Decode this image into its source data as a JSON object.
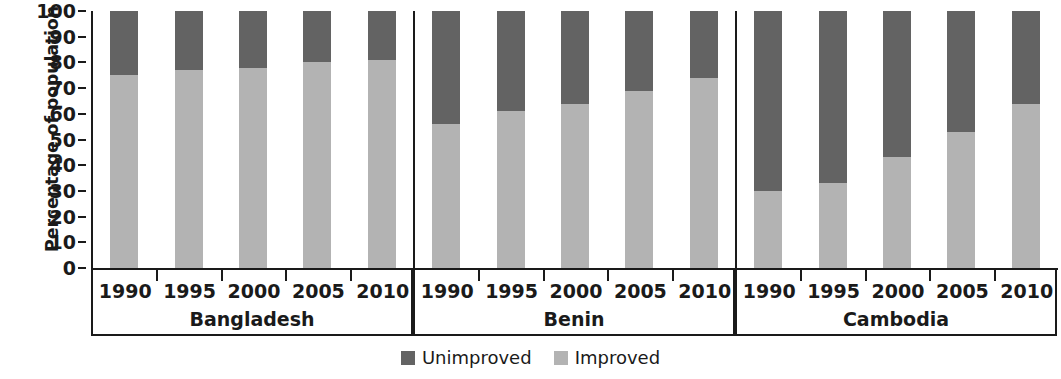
{
  "chart_data": {
    "type": "bar",
    "subtype": "stacked-bar-100",
    "title": "",
    "xlabel": "",
    "ylabel": "Percentage of population",
    "ylim": [
      0,
      100
    ],
    "ytick_labels": [
      "0",
      "10",
      "20",
      "30",
      "40",
      "50",
      "60",
      "70",
      "80",
      "90",
      "100"
    ],
    "ytick_values": [
      0,
      10,
      20,
      30,
      40,
      50,
      60,
      70,
      80,
      90,
      100
    ],
    "grid": false,
    "legend_position": "bottom-center",
    "groups": [
      "Bangladesh",
      "Benin",
      "Cambodia"
    ],
    "categories": [
      "1990",
      "1995",
      "2000",
      "2005",
      "2010"
    ],
    "series": [
      {
        "name": "Improved",
        "color": "#b3b3b3",
        "values_by_group": {
          "Bangladesh": [
            75,
            77,
            78,
            80,
            81
          ],
          "Benin": [
            56,
            61,
            64,
            69,
            74
          ],
          "Cambodia": [
            30,
            33,
            43,
            53,
            64
          ]
        }
      },
      {
        "name": "Unimproved",
        "color": "#636363",
        "values_by_group": {
          "Bangladesh": [
            25,
            23,
            22,
            20,
            19
          ],
          "Benin": [
            44,
            39,
            36,
            31,
            26
          ],
          "Cambodia": [
            70,
            67,
            57,
            47,
            36
          ]
        }
      }
    ],
    "legend": [
      {
        "label": "Unimproved",
        "color": "#636363"
      },
      {
        "label": "Improved",
        "color": "#b3b3b3"
      }
    ]
  },
  "axis": {
    "y_title": "Percentage of population"
  },
  "legend": {
    "items": [
      {
        "label": "Unimproved",
        "color": "#636363"
      },
      {
        "label": "Improved",
        "color": "#b3b3b3"
      }
    ]
  }
}
